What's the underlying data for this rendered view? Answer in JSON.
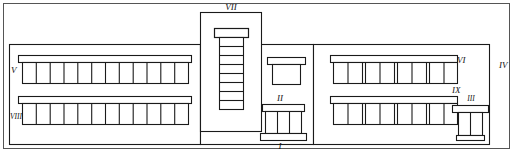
{
  "figure": {
    "type": "architectural-elevation",
    "width": 513,
    "height": 152,
    "stroke_color": "#1a1a1a",
    "fill_color": "#ffffff",
    "background": "#ffffff"
  },
  "frame": {
    "name": "outer-border",
    "x": 3,
    "y": 3,
    "width": 507,
    "height": 146
  },
  "labels": {
    "one": "I",
    "two": "II",
    "three": "III",
    "four": "IV",
    "five": "V",
    "six": "VI",
    "seven": "VII",
    "eight": "VIII",
    "nine": "IX"
  },
  "callouts": [
    {
      "id": "I",
      "text": "I",
      "x": 277,
      "y": 146,
      "target": "main-entrance-plinth"
    },
    {
      "id": "II",
      "text": "II",
      "x": 279,
      "y": 99,
      "target": "entrance-canopy"
    },
    {
      "id": "III",
      "text": "III",
      "x": 472,
      "y": 100,
      "target": "side-entrance"
    },
    {
      "id": "IV",
      "text": "IV",
      "x": 500,
      "y": 66,
      "target": "right-wing-wall"
    },
    {
      "id": "V",
      "text": "V",
      "x": 11,
      "y": 71,
      "target": "left-upper-window-band"
    },
    {
      "id": "VI",
      "text": "VI",
      "x": 455,
      "y": 61,
      "target": "right-upper-window-band"
    },
    {
      "id": "VII",
      "text": "VII",
      "x": 230,
      "y": 8,
      "target": "central-tower"
    },
    {
      "id": "VIII",
      "text": "VIII",
      "x": 13,
      "y": 117,
      "target": "left-lower-window-band"
    },
    {
      "id": "IX",
      "text": "IX",
      "x": 450,
      "y": 90,
      "target": "right-lower-window-band"
    }
  ],
  "structure": {
    "left_wing": {
      "name": "left-wing",
      "x": 9,
      "y": 44,
      "width": 191,
      "height": 100,
      "upper_band": {
        "windows": 12,
        "x": 22,
        "y": 62,
        "width": 166,
        "height": 21,
        "lintel_y": 55,
        "lintel_height": 7
      },
      "lower_band": {
        "windows": 12,
        "x": 22,
        "y": 103,
        "width": 166,
        "height": 21,
        "lintel_y": 96,
        "lintel_height": 7
      }
    },
    "central_tower": {
      "name": "central-tower",
      "x": 200,
      "y": 12,
      "width": 61,
      "height": 120,
      "window_stack": {
        "segments": 8,
        "x": 219,
        "y": 37,
        "width": 24,
        "height": 72
      },
      "cap": {
        "x": 214,
        "y": 28,
        "width": 34,
        "height": 9
      }
    },
    "middle_bay": {
      "name": "middle-bay",
      "x": 261,
      "y": 44,
      "width": 53,
      "height": 100,
      "canopy": {
        "x": 267,
        "y": 57,
        "width": 38,
        "height": 7
      },
      "canopy_body": {
        "x": 272,
        "y": 64,
        "width": 28,
        "height": 20
      },
      "entrance_lintel": {
        "x": 261,
        "y": 104,
        "width": 44,
        "height": 7
      },
      "entrance_panes": 3,
      "entrance_body": {
        "x": 264,
        "y": 111,
        "width": 38,
        "height": 22
      },
      "plinth": {
        "x": 259,
        "y": 133,
        "width": 46,
        "height": 7
      }
    },
    "right_wing": {
      "name": "right-wing",
      "x": 314,
      "y": 44,
      "width": 175,
      "height": 100,
      "upper_band": {
        "groups": 4,
        "panes_per_group": 2,
        "x": 333,
        "y": 62,
        "width": 124,
        "height": 21,
        "lintel_y": 55,
        "lintel_height": 7
      },
      "lower_band": {
        "groups": 4,
        "panes_per_group": 2,
        "x": 333,
        "y": 103,
        "width": 124,
        "height": 21,
        "lintel_y": 96,
        "lintel_height": 7
      },
      "side_entrance": {
        "lintel": {
          "x": 452,
          "y": 105,
          "width": 36,
          "height": 7
        },
        "panes": 2,
        "body": {
          "x": 458,
          "y": 112,
          "width": 24,
          "height": 23
        },
        "plinth": {
          "x": 456,
          "y": 135,
          "width": 28,
          "height": 5
        }
      }
    },
    "base_line": {
      "y": 144
    }
  }
}
